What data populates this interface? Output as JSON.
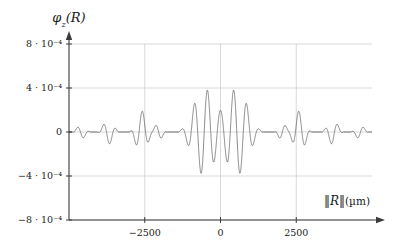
{
  "chart_data": {
    "type": "line",
    "title": "",
    "subtitle": "",
    "ylabel": "φ₂(R)",
    "ylabel_parts": {
      "phi": "φ",
      "sub": "z",
      "arg": "(R)"
    },
    "xlabel": "‖R‖(µm)",
    "xlabel_parts": {
      "norm_open": "‖",
      "var": "R",
      "norm_close": "‖",
      "unit": "(µm)"
    },
    "xlim": [
      -5000,
      5000
    ],
    "ylim": [
      -0.0008,
      0.0008
    ],
    "xticks": [
      -2500,
      0,
      2500
    ],
    "xticklabels": [
      "−2500",
      "0",
      "2500"
    ],
    "yticks": [
      0.0008,
      0.0004,
      0,
      -0.0004,
      -0.0008
    ],
    "yticklabels": [
      "8 · 10⁻⁴",
      "4 · 10⁻⁴",
      "0",
      "−4 · 10⁻⁴",
      "−8 · 10⁻⁴"
    ],
    "grid": true,
    "grid_color": "#c8c8c8",
    "axis_color": "#3a3a3a",
    "line_color": "#2b2b2b",
    "line_width": 0.55,
    "legend": [],
    "legend_position": "none",
    "annotations": [],
    "envelope_lobes": [
      {
        "center": 0,
        "half_width": 1450,
        "peak": 0.00076
      },
      {
        "center": 2050,
        "half_width": 290,
        "peak": 7.5e-05
      },
      {
        "center": -2050,
        "half_width": 290,
        "peak": 7.5e-05
      },
      {
        "center": 2600,
        "half_width": 430,
        "peak": 0.00019
      },
      {
        "center": -2600,
        "half_width": 430,
        "peak": 0.00019
      },
      {
        "center": 3700,
        "half_width": 380,
        "peak": 0.00011
      },
      {
        "center": -3700,
        "half_width": 380,
        "peak": 0.00011
      },
      {
        "center": 4600,
        "half_width": 330,
        "peak": 6e-05
      },
      {
        "center": -4600,
        "half_width": 330,
        "peak": 6e-05
      }
    ],
    "carrier_wavelength": 430,
    "central_dip": true,
    "max_abs_value": 0.00076,
    "series": [
      {
        "name": "phi_z",
        "x": [
          -5000,
          -4600,
          -4200,
          -3700,
          -3200,
          -2600,
          -2050,
          -1450,
          -900,
          -450,
          0,
          450,
          900,
          1450,
          2050,
          2600,
          3200,
          3700,
          4200,
          4600,
          5000
        ],
        "envelope": [
          0.0,
          6e-05,
          0.0,
          0.00011,
          0.0,
          0.00019,
          7.5e-05,
          0.0003,
          0.00063,
          0.00076,
          0.0002,
          0.00076,
          0.00063,
          0.0003,
          7.5e-05,
          0.00019,
          0.0,
          0.00011,
          0.0,
          6e-05,
          0.0
        ]
      }
    ]
  },
  "figure": {
    "plot_left_px": 69,
    "plot_right_px": 372,
    "zero_y_px": 132,
    "top_tick_y_px": 44
  }
}
